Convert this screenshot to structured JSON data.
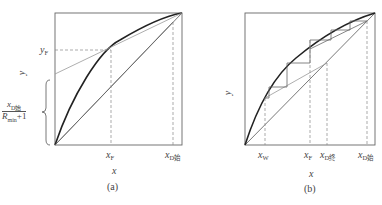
{
  "panel_a": {
    "caption": "(a)",
    "x_axis_label": "x",
    "y_axis_label": "y",
    "labels": {
      "x_F": {
        "base": "x",
        "sub": "F"
      },
      "x_D_initial": {
        "base": "x",
        "sub": "D始"
      },
      "y_F": {
        "base": "y",
        "sub": "F"
      }
    },
    "intercept_fraction": {
      "numerator_base": "x",
      "numerator_sub": "D始",
      "denominator_base": "R",
      "denominator_sub": "min",
      "denominator_suffix": "+1"
    }
  },
  "panel_b": {
    "caption": "(b)",
    "x_axis_label": "x",
    "y_axis_label": "y",
    "labels": {
      "x_W": {
        "base": "x",
        "sub": "W"
      },
      "x_F": {
        "base": "x",
        "sub": "F"
      },
      "x_D_final": {
        "base": "x",
        "sub": "D终"
      },
      "x_D_initial": {
        "base": "x",
        "sub": "D始"
      }
    }
  },
  "colors": {
    "equilibrium_curve": "#222222",
    "lines": "#555555",
    "dashed": "#888888",
    "operating_line": "#999999"
  }
}
